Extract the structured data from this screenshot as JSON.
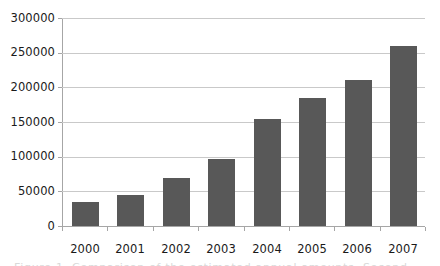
{
  "chart_data": {
    "type": "bar",
    "title": "",
    "subtitle": "",
    "xlabel": "",
    "ylabel": "",
    "categories": [
      "2000",
      "2001",
      "2002",
      "2003",
      "2004",
      "2005",
      "2006",
      "2007"
    ],
    "values": [
      35000,
      45000,
      69000,
      96000,
      155000,
      184000,
      210000,
      260000
    ],
    "ylim": [
      0,
      300000
    ],
    "ytick_values": [
      0,
      50000,
      100000,
      150000,
      200000,
      250000,
      300000
    ],
    "ytick_labels": [
      "0",
      "50000",
      "100000",
      "150000",
      "200000",
      "250000",
      "300000"
    ],
    "grid": "horizontal",
    "legend": "none",
    "series": [
      {
        "name": "",
        "color": "#585858",
        "values": [
          35000,
          45000,
          69000,
          96000,
          155000,
          184000,
          210000,
          260000
        ]
      }
    ],
    "annotations": []
  },
  "axes": {
    "y_axis_line_color": "#a6a6a6",
    "gridline_color": "#c9c9c9",
    "bar_color": "#585858",
    "background_color": "#ffffff"
  },
  "caption": {
    "clipped_text": "Figure 1. Comparison of the estimated annual amounts. Second"
  }
}
